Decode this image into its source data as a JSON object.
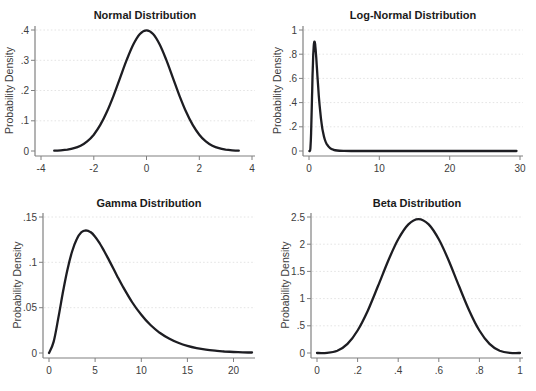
{
  "page": {
    "background": "#ffffff"
  },
  "colors": {
    "curve": "#1d1d22",
    "axis": "#808080",
    "grid": "#e4e4e4",
    "tick_label": "#3d3d3d",
    "title": "#1a1a1a",
    "axis_title": "#3d3d3d",
    "background": "#ffffff"
  },
  "chart_data": [
    {
      "type": "line",
      "title": "Normal Distribution",
      "xlabel": "",
      "ylabel": "Probability Density",
      "xlim": [
        -4,
        4
      ],
      "ylim": [
        0,
        0.4
      ],
      "grid": true,
      "legend": "none",
      "xtick_values": [
        -4,
        -2,
        0,
        2,
        4
      ],
      "xtick_labels": [
        "-4",
        "-2",
        "0",
        "2",
        "4"
      ],
      "ytick_values": [
        0,
        0.1,
        0.2,
        0.3,
        0.4
      ],
      "ytick_labels": [
        "0",
        ".1",
        ".2",
        ".3",
        ".4"
      ],
      "x": [
        -3.5,
        -3.25,
        -3,
        -2.75,
        -2.5,
        -2.25,
        -2,
        -1.75,
        -1.5,
        -1.25,
        -1,
        -0.75,
        -0.5,
        -0.25,
        0,
        0.25,
        0.5,
        0.75,
        1,
        1.25,
        1.5,
        1.75,
        2,
        2.25,
        2.5,
        2.75,
        3,
        3.25,
        3.5
      ],
      "y": [
        0.0009,
        0.002,
        0.0044,
        0.0091,
        0.0175,
        0.0317,
        0.054,
        0.0863,
        0.1295,
        0.1826,
        0.242,
        0.3011,
        0.3521,
        0.3867,
        0.3989,
        0.3867,
        0.3521,
        0.3011,
        0.242,
        0.1826,
        0.1295,
        0.0863,
        0.054,
        0.0317,
        0.0175,
        0.0091,
        0.0044,
        0.002,
        0.0009
      ]
    },
    {
      "type": "line",
      "title": "Log-Normal Distribution",
      "xlabel": "",
      "ylabel": "Probability Density",
      "xlim": [
        0,
        30
      ],
      "ylim": [
        0,
        1
      ],
      "grid": true,
      "legend": "none",
      "xtick_values": [
        0,
        10,
        20,
        30
      ],
      "xtick_labels": [
        "0",
        "10",
        "20",
        "30"
      ],
      "ytick_values": [
        0,
        0.2,
        0.4,
        0.6,
        0.8,
        1
      ],
      "ytick_labels": [
        "0",
        ".2",
        ".4",
        ".6",
        ".8",
        "1"
      ],
      "x": [
        0.05,
        0.1,
        0.2,
        0.3,
        0.4,
        0.45,
        0.5,
        0.55,
        0.6,
        0.65,
        0.7,
        0.75,
        0.8,
        0.85,
        0.9,
        1,
        1.1,
        1.2,
        1.4,
        1.6,
        1.8,
        2,
        2.25,
        2.5,
        3,
        3.5,
        4,
        5,
        6,
        8,
        10,
        14,
        18,
        22,
        26,
        29.5
      ],
      "y": [
        0,
        0.0002,
        0.0224,
        0.1466,
        0.3723,
        0.4954,
        0.6104,
        0.7099,
        0.7891,
        0.8468,
        0.8837,
        0.9016,
        0.9029,
        0.8904,
        0.8672,
        0.7979,
        0.7124,
        0.6222,
        0.4547,
        0.3206,
        0.2221,
        0.1526,
        0.0952,
        0.0596,
        0.0238,
        0.0099,
        0.0043,
        0.0009,
        0.0002,
        0,
        0,
        0,
        0,
        0,
        0,
        0
      ]
    },
    {
      "type": "line",
      "title": "Gamma Distribution",
      "xlabel": "",
      "ylabel": "Probability Density",
      "xlim": [
        0,
        22
      ],
      "ylim": [
        0,
        0.15
      ],
      "grid": true,
      "legend": "none",
      "xtick_values": [
        0,
        5,
        10,
        15,
        20
      ],
      "xtick_labels": [
        "0",
        "5",
        "10",
        "15",
        "20"
      ],
      "ytick_values": [
        0,
        0.05,
        0.1,
        0.15
      ],
      "ytick_labels": [
        "0",
        ".05",
        ".1",
        ".15"
      ],
      "x": [
        0,
        0.5,
        1,
        1.5,
        2,
        2.5,
        3,
        3.5,
        4,
        4.5,
        5,
        5.5,
        6,
        6.5,
        7,
        7.5,
        8,
        9,
        10,
        11,
        12,
        13,
        14,
        15,
        16,
        17,
        18,
        19,
        20,
        21,
        22
      ],
      "y": [
        0,
        0.0122,
        0.0379,
        0.0664,
        0.092,
        0.1119,
        0.1255,
        0.1331,
        0.1353,
        0.1334,
        0.1283,
        0.1208,
        0.112,
        0.1025,
        0.0925,
        0.0827,
        0.0733,
        0.0562,
        0.0421,
        0.0309,
        0.0223,
        0.0159,
        0.0112,
        0.0078,
        0.0054,
        0.0037,
        0.0025,
        0.0017,
        0.0011,
        0.0008,
        0.0005
      ]
    },
    {
      "type": "line",
      "title": "Beta Distribution",
      "xlabel": "",
      "ylabel": "Probability Density",
      "xlim": [
        0,
        1
      ],
      "ylim": [
        0,
        2.5
      ],
      "grid": true,
      "legend": "none",
      "xtick_values": [
        0,
        0.2,
        0.4,
        0.6,
        0.8,
        1
      ],
      "xtick_labels": [
        "0",
        ".2",
        ".4",
        ".6",
        ".8",
        "1"
      ],
      "ytick_values": [
        0,
        0.5,
        1,
        1.5,
        2,
        2.5
      ],
      "ytick_labels": [
        "0",
        ".5",
        "1",
        "1.5",
        "2",
        "2.5"
      ],
      "x": [
        0,
        0.05,
        0.1,
        0.15,
        0.2,
        0.25,
        0.3,
        0.35,
        0.4,
        0.45,
        0.5,
        0.55,
        0.6,
        0.65,
        0.7,
        0.75,
        0.8,
        0.85,
        0.9,
        0.95,
        1
      ],
      "y": [
        0,
        0.0032,
        0.0413,
        0.1665,
        0.4129,
        0.7782,
        1.2252,
        1.6879,
        2.0901,
        2.3634,
        2.4609,
        2.3634,
        2.0901,
        1.6879,
        1.2252,
        0.7782,
        0.4129,
        0.1665,
        0.0413,
        0.0032,
        0
      ]
    }
  ]
}
